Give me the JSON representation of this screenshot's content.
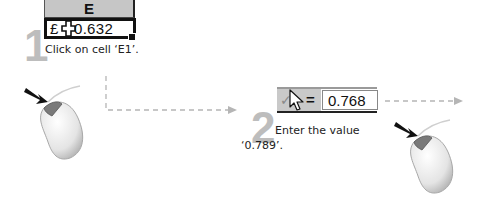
{
  "step1": {
    "number": "1",
    "column_header": "E",
    "cell_currency": "£",
    "cell_value": "0.632",
    "instruction": "Click on cell ‘E1’."
  },
  "step2": {
    "number": "2",
    "formula_equals": "=",
    "formula_value": "0.768",
    "check_glyph": "✓",
    "instruction_line1": "Enter the value",
    "instruction_line2": "‘0.789’."
  },
  "colors": {
    "step_number": "#bdbdbd",
    "header_fill": "#c6c6c6",
    "dashed_connector": "#b5b5b5"
  },
  "icons": {
    "cell_cursor": "plus-cross-cursor-icon",
    "pointer": "arrow-pointer-icon",
    "mouse": "mouse-left-click-icon"
  }
}
